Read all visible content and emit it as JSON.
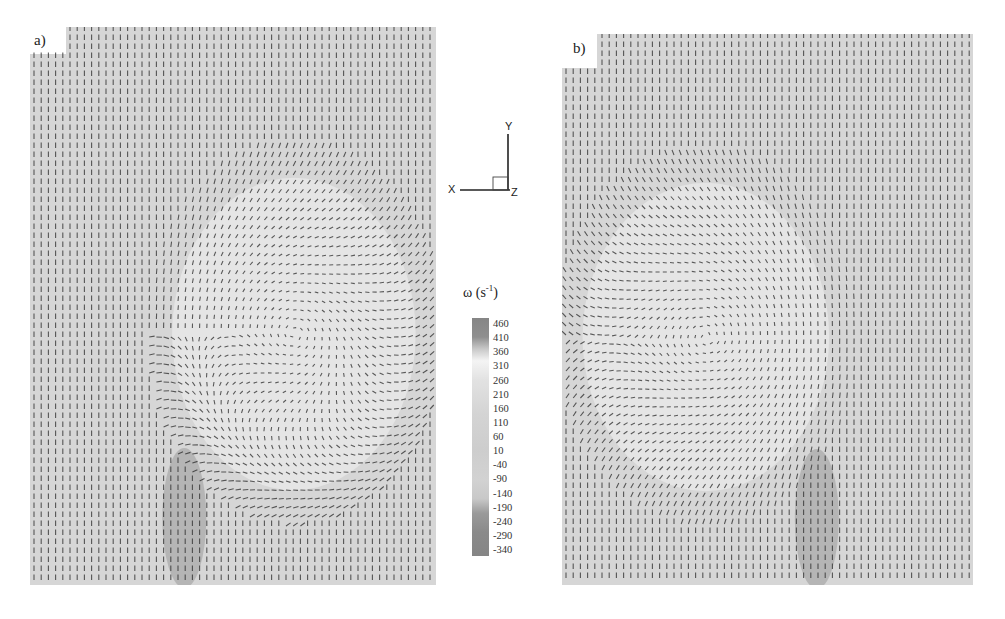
{
  "figure": {
    "panels": [
      {
        "label": "a)",
        "mirror": false
      },
      {
        "label": "b)",
        "mirror": true
      }
    ],
    "axes": {
      "x": "X",
      "y": "Y",
      "z": "Z"
    },
    "colorbar": {
      "title": "ω (s",
      "title_sup": "-1",
      "title_close": ")",
      "ticks": [
        "460",
        "410",
        "360",
        "310",
        "260",
        "210",
        "160",
        "110",
        "60",
        "10",
        "-40",
        "-90",
        "-140",
        "-190",
        "-240",
        "-290",
        "-340"
      ]
    }
  },
  "chart_data": {
    "type": "heatmap",
    "title": "",
    "panels": [
      "a)",
      "b)"
    ],
    "colorbar_label": "ω (s^-1)",
    "colorbar_range": [
      -340,
      460
    ],
    "colorbar_ticks": [
      460,
      410,
      360,
      310,
      260,
      210,
      160,
      110,
      60,
      10,
      -40,
      -90,
      -140,
      -190,
      -240,
      -290,
      -340
    ],
    "axis_triad": [
      "X",
      "Y",
      "Z"
    ]
  }
}
